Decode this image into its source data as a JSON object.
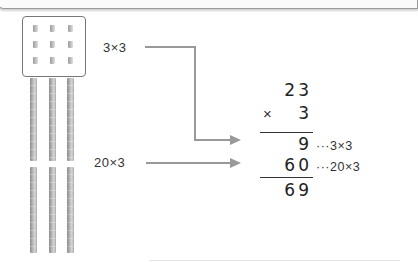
{
  "diagram": {
    "ones_block": {
      "rows": 3,
      "cols": 3,
      "count": 9
    },
    "tens_rods": {
      "columns": 3,
      "rows": 2,
      "count": 6
    },
    "labels": {
      "ones": "3×3",
      "tens": "20×3"
    },
    "multiplication": {
      "multiplicand": "23",
      "operator": "×",
      "multiplier": "3",
      "partial_1": "9",
      "partial_1_note": "···3×3",
      "partial_2": "60",
      "partial_2_note": "···20×3",
      "result": "69"
    },
    "colors": {
      "arrow": "#999999",
      "text": "#333333",
      "block": "#b0b0b0"
    }
  }
}
